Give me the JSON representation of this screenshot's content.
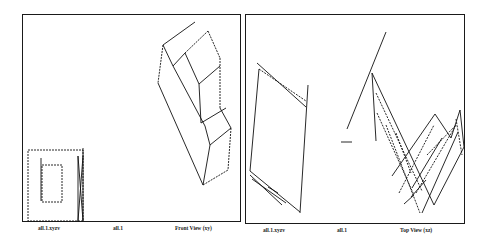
{
  "panels": [
    {
      "id": "front",
      "labels": {
        "file": "all.1.xyzv",
        "set": "all.1",
        "view": "Front View (xy)"
      }
    },
    {
      "id": "top",
      "labels": {
        "file": "all.1.xyzv",
        "set": "all.1",
        "view": "Top View (xz)"
      }
    }
  ],
  "colors": {
    "line": "#111111",
    "frame": "#1a1a1a",
    "background": "#ffffff"
  }
}
